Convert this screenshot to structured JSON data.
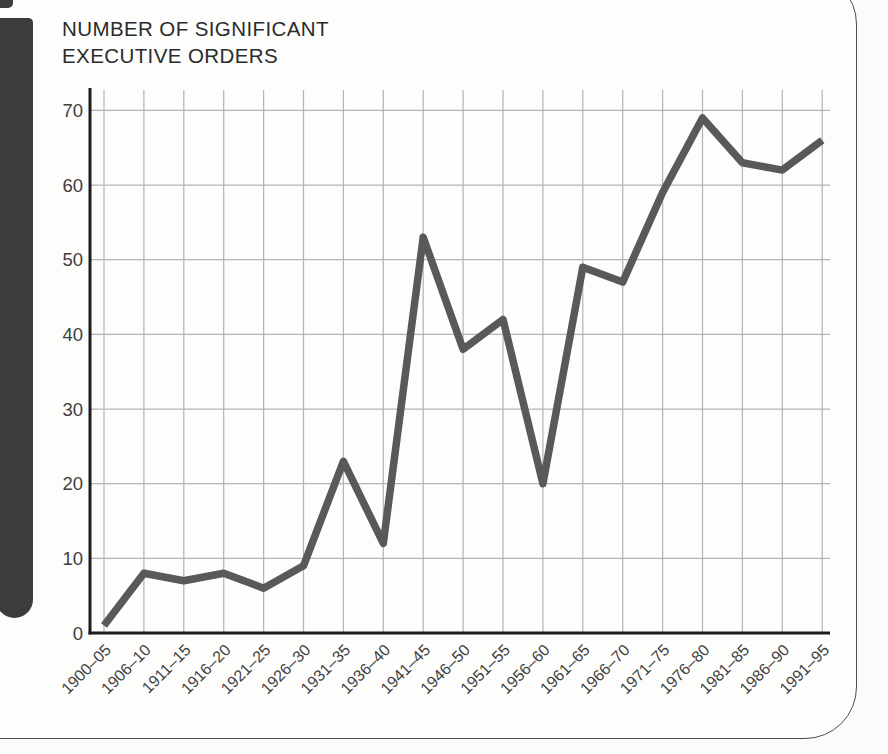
{
  "title": {
    "line1": "NUMBER OF SIGNIFICANT",
    "line2": "EXECUTIVE ORDERS"
  },
  "chart_data": {
    "type": "line",
    "title": "NUMBER OF SIGNIFICANT EXECUTIVE ORDERS",
    "categories": [
      "1900–05",
      "1906–10",
      "1911–15",
      "1916–20",
      "1921–25",
      "1926–30",
      "1931–35",
      "1936–40",
      "1941–45",
      "1946–50",
      "1951–55",
      "1956–60",
      "1961–65",
      "1966–70",
      "1971–75",
      "1976–80",
      "1981–85",
      "1986–90",
      "1991–95"
    ],
    "values": [
      1,
      8,
      7,
      8,
      6,
      9,
      23,
      12,
      53,
      38,
      42,
      20,
      49,
      47,
      59,
      69,
      63,
      62,
      66
    ],
    "xlabel": "",
    "ylabel": "",
    "ylim": [
      0,
      72
    ],
    "yticks": [
      0,
      10,
      20,
      30,
      40,
      50,
      60,
      70
    ],
    "grid": true,
    "legend": "none",
    "colors": {
      "line": "#59595b",
      "grid": "#b5b5b3",
      "axis": "#1d1d1d",
      "tick_label": "#3f3f3f"
    }
  }
}
